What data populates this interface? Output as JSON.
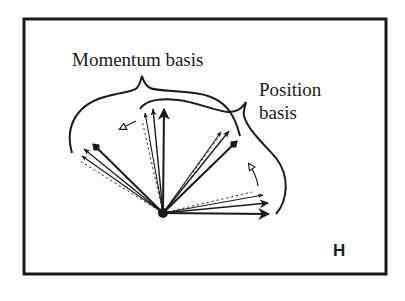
{
  "figure": {
    "panel_label": "H",
    "labels": {
      "momentum": "Momentum basis",
      "position_line1": "Position",
      "position_line2": "basis"
    },
    "colors": {
      "ink": "#1a1a1a",
      "background": "#ffffff"
    },
    "origin": [
      163,
      213
    ],
    "momentum_basis_group": {
      "description": "Fan of vectors pointing up-left and up, rotated as a set (hollow arrow shows rotation)",
      "clusters": [
        "upper-left",
        "vertical"
      ]
    },
    "position_basis_group": {
      "description": "Fan of vectors pointing up-right and right, rotated as a set (hollow arrow shows rotation)",
      "clusters": [
        "upper-right",
        "horizontal"
      ]
    }
  }
}
